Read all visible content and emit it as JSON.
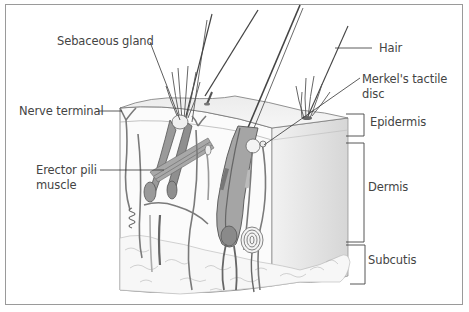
{
  "figure": {
    "labels": {
      "sebaceous_gland": "Sebaceous gland",
      "nerve_terminal": "Nerve terminal",
      "erector_pili_line1": "Erector pili",
      "erector_pili_line2": "muscle",
      "hair": "Hair",
      "merkel_line1": "Merkel's tactile",
      "merkel_line2": "disc",
      "epidermis": "Epidermis",
      "dermis": "Dermis",
      "subcutis": "Subcutis"
    },
    "layers": [
      "Epidermis",
      "Dermis",
      "Subcutis"
    ],
    "colors": {
      "outline": "#555555",
      "follicle_fill": "#8c8c8c",
      "skin_top": "#e6e6e6",
      "side_face": "#dcdcdc",
      "label_text": "#444444",
      "frame_border": "#9a9a9a"
    }
  }
}
